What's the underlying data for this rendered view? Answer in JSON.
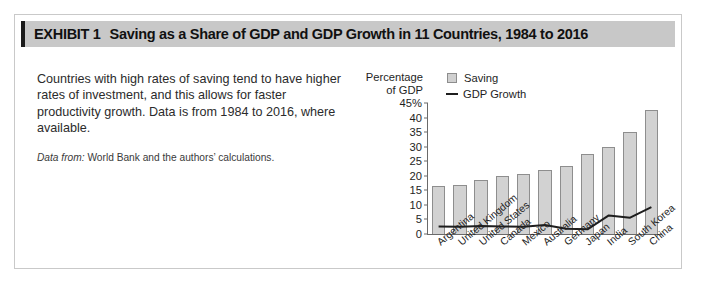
{
  "exhibit": {
    "label": "EXHIBIT 1",
    "title": "Saving as a Share of GDP and GDP Growth in 11 Countries, 1984 to 2016"
  },
  "blurb": {
    "paragraph": "Countries with high rates of saving tend to have higher rates of investment, and this allows for faster productivity growth. Data is from 1984 to 2016, where available.",
    "source_label": "Data from:",
    "source_text": "World Bank and the authors’ calculations."
  },
  "chart_data": {
    "type": "bar",
    "title": "",
    "ylabel": "Percentage of GDP",
    "ylabel_lines": [
      "Percentage",
      "of GDP"
    ],
    "xlabel": "",
    "ylim": [
      0,
      45
    ],
    "yticks": [
      45,
      40,
      35,
      30,
      25,
      20,
      15,
      10,
      5,
      0
    ],
    "ytick_labels": [
      "45%",
      "40",
      "35",
      "30",
      "25",
      "20",
      "15",
      "10",
      "5",
      "0"
    ],
    "grid": false,
    "legend_position": "top-right",
    "categories": [
      "Argentina",
      "United Kingdom",
      "United States",
      "Canada",
      "Mexico",
      "Australia",
      "Germany",
      "Japan",
      "India",
      "South Korea",
      "China"
    ],
    "series": [
      {
        "name": "Saving",
        "type": "bar",
        "color": "#d2d2d2",
        "values": [
          16.5,
          17.0,
          18.5,
          20.0,
          20.5,
          22.0,
          23.5,
          27.5,
          30.0,
          35.0,
          42.5
        ]
      },
      {
        "name": "GDP Growth",
        "type": "line",
        "color": "#1e1e1e",
        "values": [
          2.6,
          2.5,
          2.7,
          2.6,
          2.5,
          3.1,
          1.8,
          1.6,
          6.4,
          5.6,
          9.2
        ]
      }
    ]
  },
  "colors": {
    "header_band": "#c8c8c8",
    "header_accent": "#1a1a1a",
    "bar_fill": "#d2d2d2",
    "bar_stroke": "#8e8e8e",
    "line": "#1e1e1e",
    "frame": "#c9c9c9"
  }
}
